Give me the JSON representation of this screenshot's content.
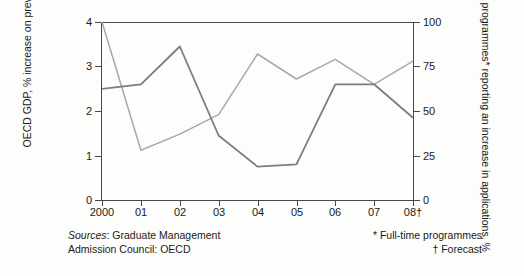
{
  "chart_data": {
    "type": "line",
    "title": "",
    "categories": [
      "2000",
      "01",
      "02",
      "03",
      "04",
      "05",
      "06",
      "07",
      "08†"
    ],
    "x": [
      2000,
      2001,
      2002,
      2003,
      2004,
      2005,
      2006,
      2007,
      2008
    ],
    "series": [
      {
        "name": "OECD GDP, % increase on previous year",
        "axis": "left",
        "color": "#7d7d7d",
        "values": [
          2.5,
          2.6,
          3.45,
          1.45,
          0.75,
          0.8,
          2.6,
          2.6,
          1.85
        ]
      },
      {
        "name": "MBA programmes* reporting an increase in applications, %",
        "axis": "right",
        "color": "#a8a8a8",
        "values": [
          100,
          28,
          37,
          48,
          82,
          68,
          79,
          65,
          78
        ]
      }
    ],
    "left_axis": {
      "label": "OECD GDP, % increase on previous year",
      "ticks": [
        "0",
        "1",
        "2",
        "3",
        "4"
      ],
      "ylim": [
        0,
        4
      ]
    },
    "right_axis": {
      "label": "MBA programmes* reporting an increase in applications, %",
      "ticks": [
        "0",
        "25",
        "50",
        "75",
        "100"
      ],
      "ylim": [
        0,
        100
      ]
    },
    "xlabel": "",
    "grid": false,
    "legend": "none",
    "sources_prefix": "Sources",
    "sources_text": ": Graduate Management",
    "sources_line2": "Admission Council: OECD",
    "note_star": "* Full-time programmes",
    "note_dagger": "† Forecast"
  }
}
